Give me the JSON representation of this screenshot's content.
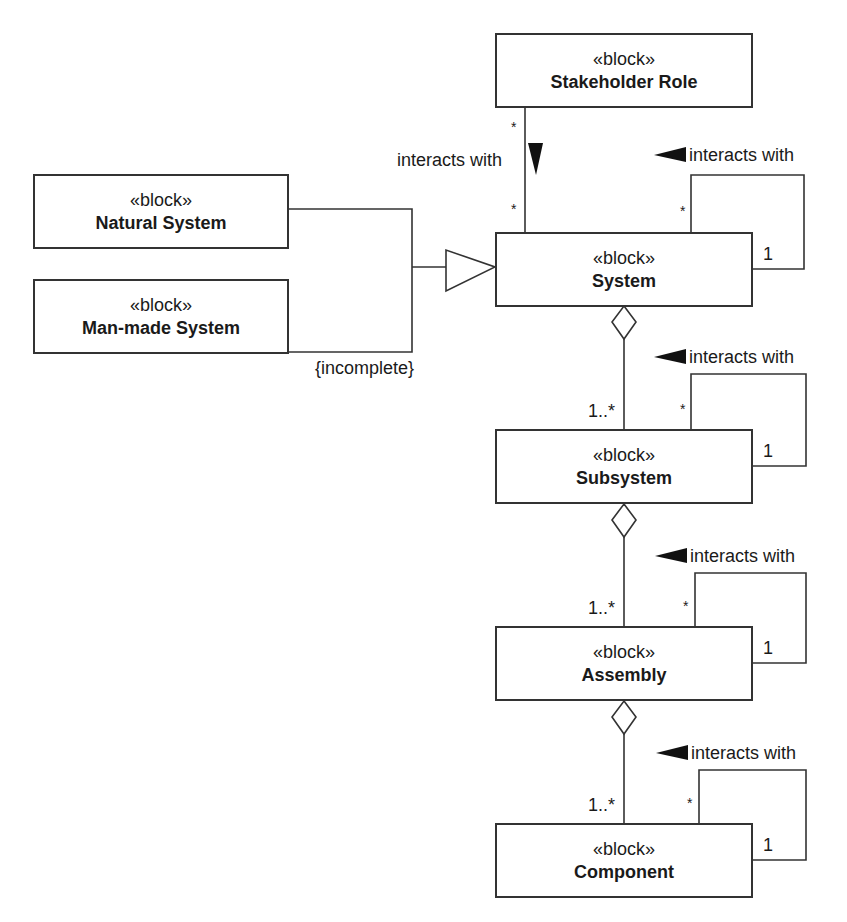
{
  "diagram": {
    "type": "SysML block definition diagram",
    "stereotype": "«block»",
    "blocks": {
      "stakeholder_role": "Stakeholder Role",
      "natural_system": "Natural System",
      "man_made_system": "Man-made System",
      "system": "System",
      "subsystem": "Subsystem",
      "assembly": "Assembly",
      "component": "Component"
    },
    "labels": {
      "interacts_with": "interacts with",
      "incomplete": "{incomplete}",
      "one_to_many": "1..*",
      "one": "1",
      "many": "*"
    },
    "relationships": [
      {
        "type": "association",
        "from": "Stakeholder Role",
        "to": "System",
        "label": "interacts with",
        "mult_from": "*",
        "mult_to": "*"
      },
      {
        "type": "generalization",
        "from": "Natural System",
        "to": "System",
        "constraint": "{incomplete}"
      },
      {
        "type": "generalization",
        "from": "Man-made System",
        "to": "System",
        "constraint": "{incomplete}"
      },
      {
        "type": "self-association",
        "block": "System",
        "label": "interacts with",
        "mult": [
          "*",
          "1"
        ]
      },
      {
        "type": "aggregation",
        "whole": "System",
        "part": "Subsystem",
        "mult": "1..*"
      },
      {
        "type": "self-association",
        "block": "Subsystem",
        "label": "interacts with",
        "mult": [
          "*",
          "1"
        ]
      },
      {
        "type": "aggregation",
        "whole": "Subsystem",
        "part": "Assembly",
        "mult": "1..*"
      },
      {
        "type": "self-association",
        "block": "Assembly",
        "label": "interacts with",
        "mult": [
          "*",
          "1"
        ]
      },
      {
        "type": "aggregation",
        "whole": "Assembly",
        "part": "Component",
        "mult": "1..*"
      },
      {
        "type": "self-association",
        "block": "Component",
        "label": "interacts with",
        "mult": [
          "*",
          "1"
        ]
      }
    ],
    "colors": {
      "line": "#333333",
      "fill": "#ffffff",
      "text": "#1a1a1a"
    }
  }
}
